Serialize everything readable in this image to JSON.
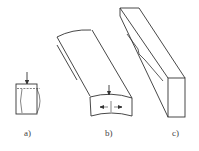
{
  "figure": {
    "panels": [
      {
        "id": "a",
        "label": "a)",
        "description": "Small rectangular specimen with vertical load arrow on top, showing bulging (barrel) deformation of sides and dashed top contact line"
      },
      {
        "id": "b",
        "label": "b)",
        "description": "Curved (bowed) slab in isometric view with vertical arrow and horizontal opposing arrows on front cross-section"
      },
      {
        "id": "c",
        "label": "c)",
        "description": "Tall rectangular bar in isometric view with a wavy crack/groove line along its side face"
      }
    ],
    "colors": {
      "stroke": "#333333",
      "background": "#ffffff",
      "label": "#444444"
    }
  }
}
